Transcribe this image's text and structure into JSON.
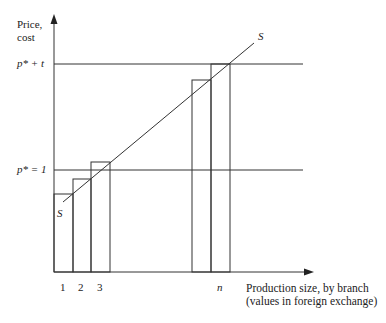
{
  "diagram": {
    "y_axis_label_line1": "Price,",
    "y_axis_label_line2": "cost",
    "x_axis_label_line1": "Production size, by branch",
    "x_axis_label_line2": "(values in foreign exchange)",
    "level_high_label": "p* + t",
    "level_low_label": "p* = 1",
    "supply_curve_label_top": "S",
    "supply_curve_label_bottom": "S",
    "branch_labels": [
      "1",
      "2",
      "3",
      "n"
    ],
    "colors": {
      "line": "#333333",
      "background": "#ffffff"
    }
  },
  "geometry": {
    "origin": [
      54,
      272
    ],
    "y_axis_top": 15,
    "x_axis_right": 313,
    "level_high_y": 64,
    "level_low_y": 170,
    "level_right_x": 303,
    "supply_line": [
      [
        63,
        202
      ],
      [
        254,
        43
      ]
    ],
    "bars": [
      {
        "label": "1",
        "x0": 54,
        "x1": 73,
        "top": 194
      },
      {
        "label": "2",
        "x0": 73,
        "x1": 91,
        "top": 179
      },
      {
        "label": "3",
        "x0": 91,
        "x1": 110,
        "top": 162
      },
      {
        "label": "",
        "x0": 192,
        "x1": 211,
        "top": 80
      },
      {
        "label": "n",
        "x0": 211,
        "x1": 230,
        "top": 64
      }
    ]
  }
}
